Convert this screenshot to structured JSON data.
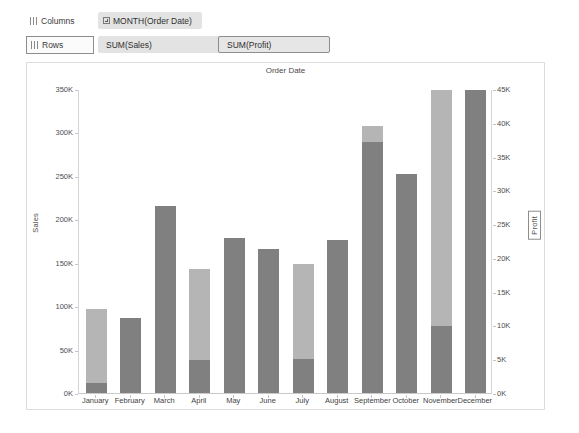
{
  "shelves": {
    "columns_label": "Columns",
    "rows_label": "Rows",
    "columns_pill": "MONTH(Order Date)",
    "rows_pill_sales": "SUM(Sales)",
    "rows_pill_profit": "SUM(Profit)"
  },
  "chart": {
    "title": "Order Date",
    "left_axis_title": "Sales",
    "right_axis_title": "Profit"
  },
  "colors": {
    "sales_bar": "#808080",
    "profit_bar": "#b5b5b5",
    "pill_background": "#e3e3e3",
    "frame_border": "#dcdcdc"
  },
  "caption": "",
  "chart_data": {
    "type": "bar",
    "title": "Order Date",
    "xlabel": "",
    "ylabel": "Sales",
    "y2label": "Profit",
    "ylim": [
      0,
      350000
    ],
    "y2lim": [
      0,
      45000
    ],
    "grid": false,
    "legend": "none",
    "stacked": true,
    "categories": [
      "January",
      "February",
      "March",
      "April",
      "May",
      "June",
      "July",
      "August",
      "September",
      "October",
      "November",
      "December"
    ],
    "left_ticks": [
      "0K",
      "50K",
      "100K",
      "150K",
      "200K",
      "250K",
      "300K",
      "350K"
    ],
    "left_tick_values": [
      0,
      50000,
      100000,
      150000,
      200000,
      250000,
      300000,
      350000
    ],
    "right_ticks": [
      "0K",
      "5K",
      "10K",
      "15K",
      "20K",
      "25K",
      "30K",
      "35K",
      "40K",
      "45K"
    ],
    "right_tick_values": [
      0,
      5000,
      10000,
      15000,
      20000,
      25000,
      30000,
      35000,
      40000,
      45000
    ],
    "series": [
      {
        "name": "SUM(Sales)",
        "axis": "left",
        "color": "#808080",
        "values": [
          97000,
          86000,
          215000,
          143000,
          178000,
          166000,
          148000,
          176000,
          308000,
          252000,
          349000,
          349000
        ]
      },
      {
        "name": "SUM(Profit)",
        "axis": "right",
        "color": "#b5b5b5",
        "values": [
          11000,
          0,
          0,
          13500,
          0,
          0,
          14000,
          0,
          2500,
          0,
          35000,
          0
        ]
      }
    ]
  }
}
